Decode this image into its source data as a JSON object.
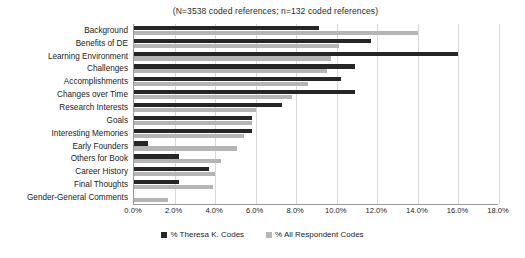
{
  "chart_data": {
    "type": "bar",
    "orientation": "horizontal",
    "title": "(N=3538 coded references; n=132 coded references)",
    "xlabel": "",
    "ylabel": "",
    "xlim": [
      0,
      18
    ],
    "xticks": [
      "0.0%",
      "2.0%",
      "4.0%",
      "6.0%",
      "8.0%",
      "10.0%",
      "12.0%",
      "14.0%",
      "16.0%",
      "18.0%"
    ],
    "xtick_values": [
      0,
      2,
      4,
      6,
      8,
      10,
      12,
      14,
      16,
      18
    ],
    "grid": true,
    "legend_position": "bottom",
    "categories": [
      "Background",
      "Benefits of DE",
      "Learning Environment",
      "Challenges",
      "Accomplishments",
      "Changes over Time",
      "Research Interests",
      "Goals",
      "Interesting Memories",
      "Early Founders",
      "Others for Book",
      "Career History",
      "Final Thoughts",
      "Gender-General Comments"
    ],
    "series": [
      {
        "name": "% Theresa K. Codes",
        "color": "#262626",
        "values": [
          9.1,
          11.7,
          16.0,
          10.9,
          10.2,
          10.9,
          7.3,
          5.8,
          5.8,
          0.7,
          2.2,
          3.7,
          2.2,
          0.0
        ]
      },
      {
        "name": "% All Respondent Codes",
        "color": "#b5b5b5",
        "values": [
          14.0,
          10.1,
          9.7,
          9.5,
          8.6,
          7.8,
          6.0,
          5.8,
          5.4,
          5.1,
          4.3,
          4.0,
          3.9,
          1.7
        ]
      }
    ]
  },
  "colors": {
    "series_dark": "#262626",
    "series_light": "#b5b5b5",
    "gridline": "#d9d9d9",
    "axis": "#9a9a9a",
    "background": "#ffffff"
  }
}
